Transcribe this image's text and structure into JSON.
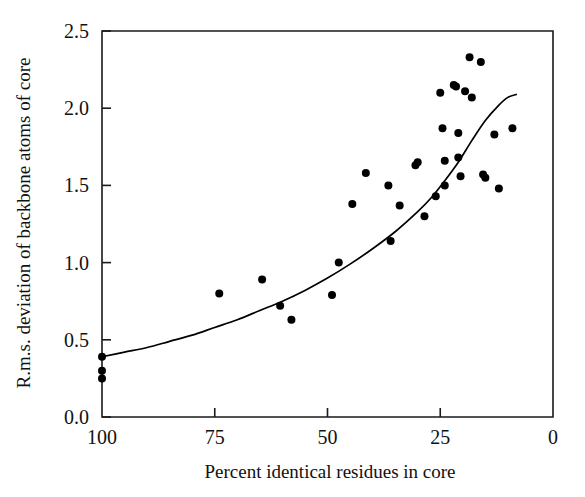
{
  "chart_data": {
    "type": "scatter",
    "title": "",
    "xlabel": "Percent identical residues in core",
    "ylabel": "R.m.s. deviation of backbone atoms of core",
    "xlim": [
      100,
      0
    ],
    "ylim": [
      0.0,
      2.5
    ],
    "x_reversed": true,
    "grid": false,
    "legend": null,
    "xticks": [
      100,
      75,
      50,
      25,
      0
    ],
    "xticklabels": [
      "100",
      "75",
      "50",
      "25",
      "0"
    ],
    "yticks": [
      0.0,
      0.5,
      1.0,
      1.5,
      2.0,
      2.5
    ],
    "yticklabels": [
      "0.0",
      "0.5",
      "1.0",
      "1.5",
      "2.0",
      "2.5"
    ],
    "marker": "filled-circle",
    "marker_color": "#000000",
    "marker_size_px": 8,
    "points": [
      {
        "x": 100.0,
        "y": 0.39
      },
      {
        "x": 100.0,
        "y": 0.3
      },
      {
        "x": 100.0,
        "y": 0.25
      },
      {
        "x": 74.0,
        "y": 0.8
      },
      {
        "x": 64.5,
        "y": 0.89
      },
      {
        "x": 60.5,
        "y": 0.72
      },
      {
        "x": 58.0,
        "y": 0.63
      },
      {
        "x": 49.0,
        "y": 0.79
      },
      {
        "x": 47.5,
        "y": 1.0
      },
      {
        "x": 44.5,
        "y": 1.38
      },
      {
        "x": 41.5,
        "y": 1.58
      },
      {
        "x": 36.5,
        "y": 1.5
      },
      {
        "x": 36.0,
        "y": 1.14
      },
      {
        "x": 34.0,
        "y": 1.37
      },
      {
        "x": 30.5,
        "y": 1.63
      },
      {
        "x": 30.0,
        "y": 1.65
      },
      {
        "x": 28.5,
        "y": 1.3
      },
      {
        "x": 26.0,
        "y": 1.43
      },
      {
        "x": 25.0,
        "y": 2.1
      },
      {
        "x": 24.5,
        "y": 1.87
      },
      {
        "x": 24.0,
        "y": 1.66
      },
      {
        "x": 24.0,
        "y": 1.5
      },
      {
        "x": 22.0,
        "y": 2.15
      },
      {
        "x": 21.5,
        "y": 2.14
      },
      {
        "x": 21.0,
        "y": 1.84
      },
      {
        "x": 21.0,
        "y": 1.68
      },
      {
        "x": 20.5,
        "y": 1.56
      },
      {
        "x": 19.5,
        "y": 2.11
      },
      {
        "x": 18.5,
        "y": 2.33
      },
      {
        "x": 18.0,
        "y": 2.07
      },
      {
        "x": 16.0,
        "y": 2.3
      },
      {
        "x": 15.5,
        "y": 1.57
      },
      {
        "x": 15.0,
        "y": 1.55
      },
      {
        "x": 13.0,
        "y": 1.83
      },
      {
        "x": 12.0,
        "y": 1.48
      },
      {
        "x": 9.0,
        "y": 1.87
      }
    ],
    "fit_curve": {
      "label": "exponential fit",
      "color": "#000000",
      "x_start": 100,
      "x_end": 8,
      "points": [
        {
          "x": 100,
          "y": 0.39
        },
        {
          "x": 95,
          "y": 0.42
        },
        {
          "x": 90,
          "y": 0.45
        },
        {
          "x": 85,
          "y": 0.49
        },
        {
          "x": 80,
          "y": 0.53
        },
        {
          "x": 75,
          "y": 0.58
        },
        {
          "x": 70,
          "y": 0.63
        },
        {
          "x": 65,
          "y": 0.69
        },
        {
          "x": 60,
          "y": 0.75
        },
        {
          "x": 55,
          "y": 0.82
        },
        {
          "x": 50,
          "y": 0.9
        },
        {
          "x": 45,
          "y": 0.99
        },
        {
          "x": 40,
          "y": 1.09
        },
        {
          "x": 35,
          "y": 1.2
        },
        {
          "x": 30,
          "y": 1.33
        },
        {
          "x": 27,
          "y": 1.42
        },
        {
          "x": 24,
          "y": 1.53
        },
        {
          "x": 21,
          "y": 1.65
        },
        {
          "x": 18,
          "y": 1.79
        },
        {
          "x": 15,
          "y": 1.92
        },
        {
          "x": 12,
          "y": 2.02
        },
        {
          "x": 10,
          "y": 2.07
        },
        {
          "x": 8,
          "y": 2.09
        }
      ]
    }
  },
  "axes": {
    "y_title": "R.m.s. deviation of backbone atoms of core",
    "x_title": "Percent identical residues in core"
  }
}
